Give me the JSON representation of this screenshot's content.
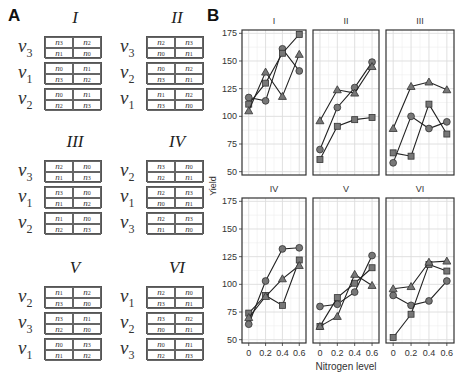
{
  "panel_a": {
    "letter": "A",
    "designs": [
      {
        "title": "I",
        "rows": [
          {
            "v": "3",
            "cells": [
              "3",
              "2",
              "1",
              "0"
            ]
          },
          {
            "v": "1",
            "cells": [
              "0",
              "1",
              "3",
              "2"
            ]
          },
          {
            "v": "2",
            "cells": [
              "0",
              "1",
              "2",
              "3"
            ]
          }
        ]
      },
      {
        "title": "II",
        "rows": [
          {
            "v": "3",
            "cells": [
              "2",
              "3",
              "0",
              "1"
            ]
          },
          {
            "v": "2",
            "cells": [
              "0",
              "2",
              "3",
              "1"
            ]
          },
          {
            "v": "1",
            "cells": [
              "1",
              "2",
              "3",
              "0"
            ]
          }
        ]
      },
      {
        "title": "III",
        "rows": [
          {
            "v": "3",
            "cells": [
              "2",
              "0",
              "1",
              "3"
            ]
          },
          {
            "v": "1",
            "cells": [
              "3",
              "0",
              "1",
              "2"
            ]
          },
          {
            "v": "2",
            "cells": [
              "1",
              "0",
              "2",
              "3"
            ]
          }
        ]
      },
      {
        "title": "IV",
        "rows": [
          {
            "v": "2",
            "cells": [
              "3",
              "0",
              "2",
              "1"
            ]
          },
          {
            "v": "1",
            "cells": [
              "2",
              "3",
              "0",
              "1"
            ]
          },
          {
            "v": "3",
            "cells": [
              "2",
              "3",
              "1",
              "0"
            ]
          }
        ]
      },
      {
        "title": "V",
        "rows": [
          {
            "v": "2",
            "cells": [
              "1",
              "2",
              "3",
              "0"
            ]
          },
          {
            "v": "3",
            "cells": [
              "3",
              "1",
              "2",
              "0"
            ]
          },
          {
            "v": "1",
            "cells": [
              "0",
              "3",
              "1",
              "2"
            ]
          }
        ]
      },
      {
        "title": "VI",
        "rows": [
          {
            "v": "1",
            "cells": [
              "2",
              "0",
              "3",
              "1"
            ]
          },
          {
            "v": "2",
            "cells": [
              "3",
              "2",
              "0",
              "1"
            ]
          },
          {
            "v": "3",
            "cells": [
              "0",
              "1",
              "2",
              "3"
            ]
          }
        ]
      }
    ]
  },
  "panel_b": {
    "letter": "B"
  },
  "chart_data": {
    "type": "line",
    "title": "",
    "xlabel": "Nitrogen level",
    "ylabel": "Yield",
    "x": [
      0,
      0.2,
      0.4,
      0.6
    ],
    "xticks": [
      "0",
      "0.2",
      "0.4",
      "0.6"
    ],
    "yticks": [
      50,
      75,
      100,
      125,
      150,
      175
    ],
    "ylim": [
      47,
      178
    ],
    "grid": true,
    "facets": [
      {
        "label": "I",
        "series": [
          {
            "name": "circle",
            "values": [
              117,
              114,
              161,
              141
            ]
          },
          {
            "name": "square",
            "values": [
              111,
              130,
              157,
              174
            ]
          },
          {
            "name": "triangle",
            "values": [
              105,
              140,
              118,
              156
            ]
          }
        ]
      },
      {
        "label": "II",
        "series": [
          {
            "name": "circle",
            "values": [
              70,
              108,
              126,
              149
            ]
          },
          {
            "name": "square",
            "values": [
              61,
              91,
              97,
              99
            ]
          },
          {
            "name": "triangle",
            "values": [
              96,
              124,
              121,
              145
            ]
          }
        ]
      },
      {
        "label": "III",
        "series": [
          {
            "name": "circle",
            "values": [
              58,
              100,
              89,
              95
            ]
          },
          {
            "name": "square",
            "values": [
              67,
              64,
              111,
              84
            ]
          },
          {
            "name": "triangle",
            "values": [
              89,
              127,
              131,
              124
            ]
          }
        ]
      },
      {
        "label": "IV",
        "series": [
          {
            "name": "circle",
            "values": [
              64,
              103,
              132,
              133
            ]
          },
          {
            "name": "square",
            "values": [
              74,
              90,
              81,
              122
            ]
          },
          {
            "name": "triangle",
            "values": [
              70,
              89,
              105,
              117
            ]
          }
        ]
      },
      {
        "label": "V",
        "series": [
          {
            "name": "circle",
            "values": [
              80,
              82,
              93,
              126
            ]
          },
          {
            "name": "square",
            "values": [
              62,
              88,
              101,
              115
            ]
          },
          {
            "name": "triangle",
            "values": [
              62,
              71,
              109,
              99
            ]
          }
        ]
      },
      {
        "label": "VI",
        "series": [
          {
            "name": "circle",
            "values": [
              90,
              81,
              85,
              103
            ]
          },
          {
            "name": "square",
            "values": [
              52,
              73,
              118,
              112
            ]
          },
          {
            "name": "triangle",
            "values": [
              96,
              98,
              120,
              121
            ]
          }
        ]
      }
    ]
  }
}
